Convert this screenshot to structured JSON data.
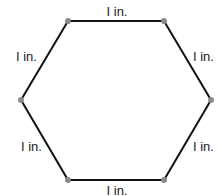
{
  "diagram": {
    "title": "",
    "shape": "regular hexagon",
    "colors": {
      "edge": "#111111",
      "vertex": "#8a8a8a",
      "label": "#222222",
      "background": "#ffffff"
    },
    "vertices": [
      {
        "id": "top-left",
        "x": 68,
        "y": 21
      },
      {
        "id": "top-right",
        "x": 164,
        "y": 21
      },
      {
        "id": "right",
        "x": 211,
        "y": 100
      },
      {
        "id": "bottom-right",
        "x": 164,
        "y": 180
      },
      {
        "id": "bottom-left",
        "x": 68,
        "y": 180
      },
      {
        "id": "left",
        "x": 21,
        "y": 100
      }
    ],
    "edges": [
      {
        "id": "top",
        "label": "I in.",
        "label_x": 117,
        "label_y": 16,
        "anchor": "middle"
      },
      {
        "id": "upper-right",
        "label": "I in.",
        "label_x": 193,
        "label_y": 61,
        "anchor": "start"
      },
      {
        "id": "lower-right",
        "label": "I in.",
        "label_x": 193,
        "label_y": 151,
        "anchor": "start"
      },
      {
        "id": "bottom",
        "label": "I in.",
        "label_x": 117,
        "label_y": 195,
        "anchor": "middle"
      },
      {
        "id": "lower-left",
        "label": "I in.",
        "label_x": 21,
        "label_y": 151,
        "anchor": "start"
      },
      {
        "id": "upper-left",
        "label": "I in.",
        "label_x": 16,
        "label_y": 61,
        "anchor": "start"
      }
    ]
  }
}
